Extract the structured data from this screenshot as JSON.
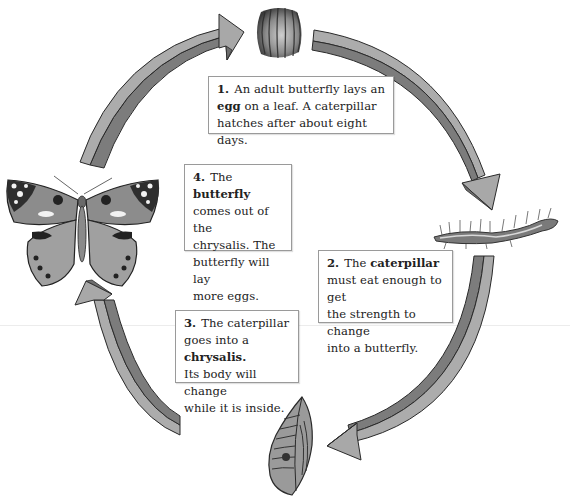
{
  "colors": {
    "arrow_light": "#a8a8a8",
    "arrow_dark": "#7c7c7c",
    "arrow_outline": "#2a2a2a",
    "box_border": "#9a9a9a"
  },
  "stages": [
    {
      "id": "egg",
      "image": "egg-illustration",
      "number": "1.",
      "parts": [
        {
          "text": "An adult butterfly lays an ",
          "bold": false
        },
        {
          "text": "egg",
          "bold": true
        },
        {
          "text": " on a leaf. A caterpillar hatches after about eight days.",
          "bold": false
        }
      ]
    },
    {
      "id": "caterpillar",
      "image": "caterpillar-illustration",
      "number": "2.",
      "parts": [
        {
          "text": "The ",
          "bold": false
        },
        {
          "text": "caterpillar",
          "bold": true
        },
        {
          "text": " must eat enough to get the strength to change into a butterfly.",
          "bold": false
        }
      ]
    },
    {
      "id": "chrysalis",
      "image": "chrysalis-illustration",
      "number": "3.",
      "parts": [
        {
          "text": "The caterpillar goes into a ",
          "bold": false
        },
        {
          "text": "chrysalis.",
          "bold": true
        },
        {
          "text": " Its body will change while it is inside.",
          "bold": false
        }
      ]
    },
    {
      "id": "butterfly",
      "image": "butterfly-illustration",
      "number": "4.",
      "parts": [
        {
          "text": "The ",
          "bold": false
        },
        {
          "text": "butterfly",
          "bold": true
        },
        {
          "text": " comes out of the chrysalis. The butterfly will lay more eggs.",
          "bold": false
        }
      ]
    }
  ],
  "arrows": [
    {
      "from": "butterfly",
      "to": "egg",
      "icon": "curved-arrow-icon"
    },
    {
      "from": "egg",
      "to": "caterpillar",
      "icon": "curved-arrow-icon"
    },
    {
      "from": "caterpillar",
      "to": "chrysalis",
      "icon": "curved-arrow-icon"
    },
    {
      "from": "chrysalis",
      "to": "butterfly",
      "icon": "curved-arrow-icon"
    }
  ],
  "text": {
    "box1": {
      "num": "1.",
      "a": "An adult butterfly lays an",
      "b": "egg",
      "c": "on a leaf. A caterpillar",
      "d": "hatches after about eight days."
    },
    "box2": {
      "num": "2.",
      "a": "The",
      "b": "caterpillar",
      "c": "must eat enough to get",
      "d": "the strength to change",
      "e": "into a butterfly."
    },
    "box3": {
      "num": "3.",
      "a": "The caterpillar",
      "b": "goes into a",
      "c": "chrysalis.",
      "d": "Its body will change",
      "e": "while it is inside."
    },
    "box4": {
      "num": "4.",
      "a": "The",
      "b": "butterfly",
      "c": "comes out of the",
      "d": "chrysalis. The",
      "e": "butterfly will lay",
      "f": "more eggs."
    }
  }
}
